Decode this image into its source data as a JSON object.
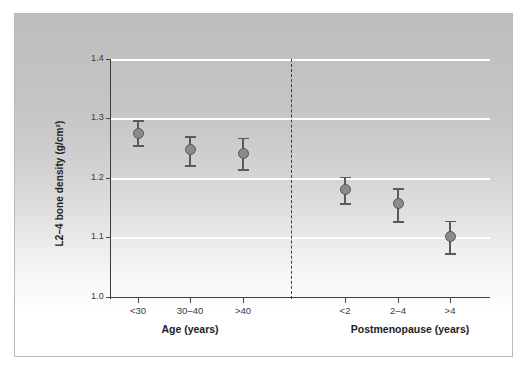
{
  "figure": {
    "background_color": "#ffffff",
    "panel_gradient_top": "#bdbdbd",
    "panel_gradient_bottom": "#fdfdfd",
    "frame_color": "#b9b9b9",
    "gridline_color": "#ffffff",
    "axis_color": "#3c3c3c",
    "marker_fill_color": "#8a8a8a",
    "marker_edge_color": "#565656",
    "errorbar_color": "#5a5a5a",
    "divider_color": "#3d3d3d"
  },
  "chart_data": {
    "type": "scatter",
    "title": "",
    "xlabel": "",
    "ylabel": "L2–4 bone density (g/cm²)",
    "ylim": [
      1.0,
      1.4
    ],
    "yticks": [
      "1.0",
      "1.1",
      "1.2",
      "1.3",
      "1.4"
    ],
    "ytick_values": [
      1.0,
      1.1,
      1.2,
      1.3,
      1.4
    ],
    "grid": "horizontal",
    "gridlines_at": [
      1.1,
      1.2,
      1.3,
      1.4
    ],
    "legend": "none",
    "panel_divider": true,
    "groups": [
      {
        "name": "Age (years)",
        "label": "Age (years)",
        "categories": [
          "<30",
          "30–40",
          ">40"
        ],
        "values": [
          1.275,
          1.248,
          1.242
        ],
        "err_low": [
          1.255,
          1.222,
          1.215
        ],
        "err_high": [
          1.297,
          1.27,
          1.268
        ]
      },
      {
        "name": "Postmenopause (years)",
        "label": "Postmenopause (years)",
        "categories": [
          "<2",
          "2–4",
          ">4"
        ],
        "values": [
          1.18,
          1.157,
          1.102
        ],
        "err_low": [
          1.158,
          1.127,
          1.074
        ],
        "err_high": [
          1.202,
          1.183,
          1.128
        ]
      }
    ],
    "points": [
      {
        "category": "<30",
        "group": "Age (years)",
        "value": 1.275,
        "err_low": 1.255,
        "err_high": 1.297
      },
      {
        "category": "30–40",
        "group": "Age (years)",
        "value": 1.248,
        "err_low": 1.222,
        "err_high": 1.27
      },
      {
        "category": ">40",
        "group": "Age (years)",
        "value": 1.242,
        "err_low": 1.215,
        "err_high": 1.268
      },
      {
        "category": "<2",
        "group": "Postmenopause (years)",
        "value": 1.18,
        "err_low": 1.158,
        "err_high": 1.202
      },
      {
        "category": "2–4",
        "group": "Postmenopause (years)",
        "value": 1.157,
        "err_low": 1.127,
        "err_high": 1.183
      },
      {
        "category": ">4",
        "group": "Postmenopause (years)",
        "value": 1.102,
        "err_low": 1.074,
        "err_high": 1.128
      }
    ]
  }
}
